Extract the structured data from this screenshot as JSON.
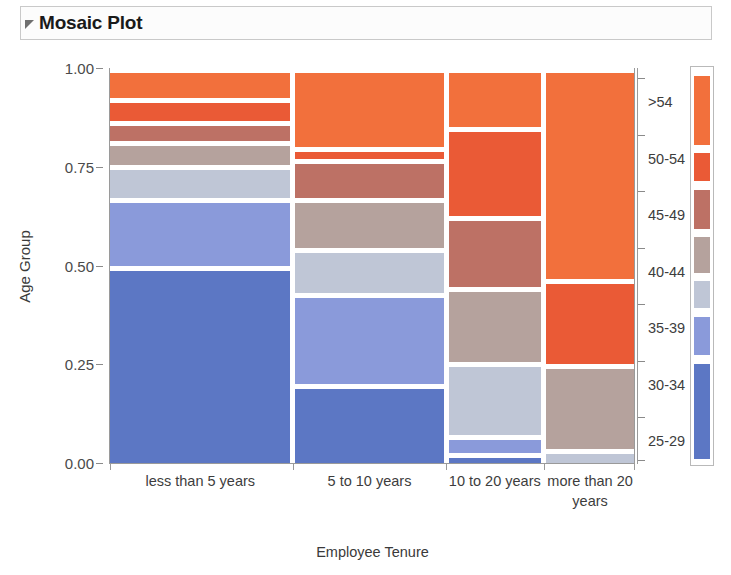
{
  "panel": {
    "title": "Mosaic Plot",
    "disclosure_icon": "triangle-collapse-icon"
  },
  "chart_data": {
    "type": "mosaic",
    "title": "Mosaic Plot",
    "xlabel": "Employee Tenure",
    "ylabel": "Age Group",
    "ylim": [
      0,
      1
    ],
    "y_ticks": [
      "0.00",
      "0.25",
      "0.50",
      "0.75",
      "1.00"
    ],
    "y_tick_values": [
      0.0,
      0.25,
      0.5,
      0.75,
      1.0
    ],
    "grid": false,
    "legend_position": "right",
    "categories": [
      "less than 5 years",
      "5 to 10 years",
      "10 to 20 years",
      "more than 20 years"
    ],
    "column_widths": [
      0.345,
      0.283,
      0.177,
      0.168
    ],
    "age_groups": [
      "25-29",
      "30-34",
      "35-39",
      "40-44",
      "45-49",
      "50-54",
      ">54"
    ],
    "colors": {
      "25-29": "#5c77c4",
      "30-34": "#8a9ada",
      "35-39": "#bfc6d6",
      "40-44": "#b5a29d",
      "45-49": "#bd7165",
      "50-54": "#ea5a36",
      ">54": "#f2703c"
    },
    "series": [
      {
        "name": "25-29",
        "color": "#5c77c4",
        "values": [
          0.5,
          0.2,
          0.025,
          0.0
        ]
      },
      {
        "name": "30-34",
        "color": "#8a9ada",
        "values": [
          0.17,
          0.23,
          0.045,
          0.0
        ]
      },
      {
        "name": "35-39",
        "color": "#bfc6d6",
        "values": [
          0.085,
          0.115,
          0.185,
          0.035
        ]
      },
      {
        "name": "40-44",
        "color": "#b5a29d",
        "values": [
          0.06,
          0.125,
          0.19,
          0.215
        ]
      },
      {
        "name": "45-49",
        "color": "#bd7165",
        "values": [
          0.05,
          0.1,
          0.18,
          0.0
        ]
      },
      {
        "name": "50-54",
        "color": "#ea5a36",
        "values": [
          0.06,
          0.03,
          0.225,
          0.215
        ]
      },
      {
        "name": ">54",
        "color": "#f2703c",
        "values": [
          0.075,
          0.2,
          0.15,
          0.535
        ]
      }
    ],
    "legend_entries": [
      {
        "label": ">54",
        "color": "#f2703c",
        "top": 0.015,
        "bottom": 0.255
      },
      {
        "label": "50-54",
        "color": "#ea5a36",
        "top": 0.27,
        "bottom": 0.375
      },
      {
        "label": "45-49",
        "color": "#bd7165",
        "top": 0.39,
        "bottom": 0.53
      },
      {
        "label": "40-44",
        "color": "#b5a29d",
        "top": 0.545,
        "bottom": 0.675
      },
      {
        "label": "35-39",
        "color": "#bfc6d6",
        "top": 0.69,
        "bottom": 0.79
      },
      {
        "label": "30-34",
        "color": "#8a9ada",
        "top": 0.805,
        "bottom": 0.945
      },
      {
        "label": "25-29",
        "color": "#5c77c4",
        "top": 0.96,
        "bottom": 1.285
      }
    ]
  }
}
